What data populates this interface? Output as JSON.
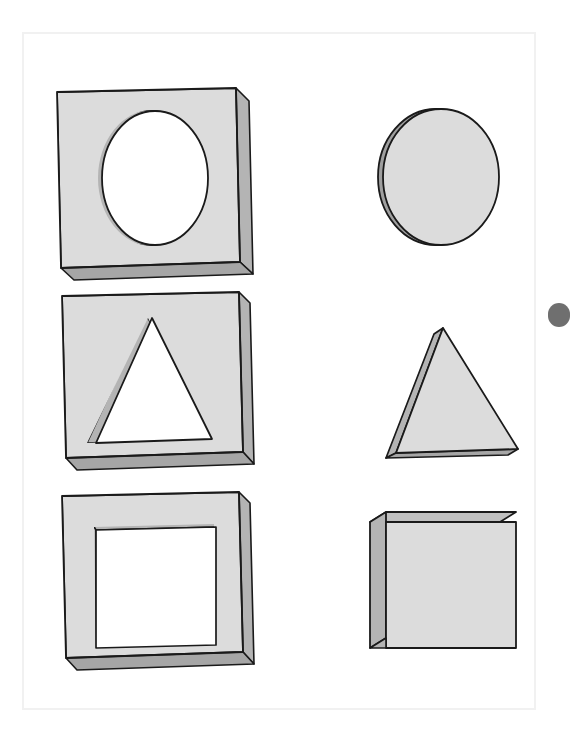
{
  "page": {
    "background_color": "#ffffff",
    "border_color": "#f1f1f1",
    "frame": {
      "x": 22,
      "y": 32,
      "width": 514,
      "height": 678
    }
  },
  "palette": {
    "face_light": "#dcdcdc",
    "face_lighter": "#e2e2e2",
    "face_top": "#c8c8c8",
    "side_mid": "#b4b4b4",
    "side_dark": "#a6a6a6",
    "inner_wall": "#bdbdbd",
    "outline": "#1a1a1a",
    "hole_fill": "#ffffff",
    "edge_pill": "#6f6f6f"
  },
  "figure": {
    "type": "isometric-solids-illustration",
    "columns": [
      {
        "name": "plates-column",
        "label": "Plates with cut-out holes"
      },
      {
        "name": "solids-column",
        "label": "Matching solid shapes"
      }
    ],
    "rows": [
      {
        "name": "circle-row",
        "hole_shape": "circle",
        "solid_shape": "cylinder"
      },
      {
        "name": "triangle-row",
        "hole_shape": "triangle",
        "solid_shape": "triangular-prism"
      },
      {
        "name": "square-row",
        "hole_shape": "square",
        "solid_shape": "cube"
      }
    ]
  },
  "shapes": [
    {
      "id": "plate-circle",
      "name": "plate-with-circular-hole",
      "column": "left",
      "row": 1,
      "kind": "plate",
      "hole": "circle",
      "bounds": {
        "x": 57,
        "y": 88,
        "width": 192,
        "height": 190
      }
    },
    {
      "id": "plate-triangle",
      "name": "plate-with-triangular-hole",
      "column": "left",
      "row": 2,
      "kind": "plate",
      "hole": "triangle",
      "bounds": {
        "x": 62,
        "y": 292,
        "width": 188,
        "height": 180
      }
    },
    {
      "id": "plate-square",
      "name": "plate-with-square-hole",
      "column": "left",
      "row": 3,
      "kind": "plate",
      "hole": "square",
      "bounds": {
        "x": 62,
        "y": 492,
        "width": 188,
        "height": 180
      }
    },
    {
      "id": "solid-cylinder",
      "name": "cylinder-disc",
      "column": "right",
      "row": 1,
      "kind": "solid",
      "bounds": {
        "x": 378,
        "y": 108,
        "width": 122,
        "height": 138
      }
    },
    {
      "id": "solid-prism",
      "name": "triangular-prism",
      "column": "right",
      "row": 2,
      "kind": "solid",
      "bounds": {
        "x": 378,
        "y": 318,
        "width": 148,
        "height": 152
      }
    },
    {
      "id": "solid-cube",
      "name": "cube-block",
      "column": "right",
      "row": 3,
      "kind": "solid",
      "bounds": {
        "x": 370,
        "y": 510,
        "width": 146,
        "height": 140
      }
    }
  ],
  "overlay": {
    "edge_pill": {
      "name": "edge-pill-indicator",
      "color": "#6f6f6f",
      "x": 548,
      "y": 303,
      "width": 22,
      "height": 24
    }
  }
}
